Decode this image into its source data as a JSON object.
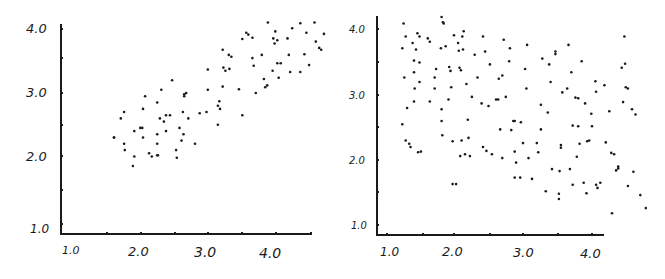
{
  "chart_data": [
    {
      "type": "scatter",
      "title": "",
      "xlabel": "",
      "ylabel": "",
      "xlim": [
        0.9,
        4.6
      ],
      "ylim": [
        0.9,
        4.1
      ],
      "grid": false,
      "legend": null,
      "x_ticks": [
        "1.0",
        "2.0",
        "3.0",
        "4.0"
      ],
      "y_ticks": [
        "1.0",
        "2.0",
        "3.0",
        "4.0"
      ],
      "trend": "positive correlation",
      "points": [
        [
          1.6,
          2.3
        ],
        [
          1.6,
          2.3
        ],
        [
          1.7,
          2.6
        ],
        [
          1.75,
          2.7
        ],
        [
          1.75,
          2.2
        ],
        [
          1.76,
          2.1
        ],
        [
          1.9,
          2.4
        ],
        [
          1.9,
          2.0
        ],
        [
          1.88,
          1.85
        ],
        [
          1.99,
          2.45
        ],
        [
          2.02,
          2.45
        ],
        [
          2.03,
          2.3
        ],
        [
          2.03,
          2.75
        ],
        [
          2.06,
          2.95
        ],
        [
          2.12,
          2.05
        ],
        [
          2.16,
          2.0
        ],
        [
          2.24,
          2.2
        ],
        [
          2.24,
          2.35
        ],
        [
          2.24,
          2.85
        ],
        [
          2.24,
          2.02
        ],
        [
          2.25,
          2.02
        ],
        [
          2.28,
          2.6
        ],
        [
          2.3,
          3.05
        ],
        [
          2.37,
          2.4
        ],
        [
          2.37,
          2.65
        ],
        [
          2.34,
          2.55
        ],
        [
          2.43,
          2.65
        ],
        [
          2.46,
          3.2
        ],
        [
          2.52,
          2.1
        ],
        [
          2.53,
          1.98
        ],
        [
          2.57,
          2.45
        ],
        [
          2.6,
          2.25
        ],
        [
          2.63,
          2.35
        ],
        [
          2.62,
          2.7
        ],
        [
          2.64,
          2.95
        ],
        [
          2.64,
          2.98
        ],
        [
          2.67,
          3.0
        ],
        [
          2.7,
          2.6
        ],
        [
          2.8,
          2.2
        ],
        [
          2.87,
          2.68
        ],
        [
          2.97,
          2.7
        ],
        [
          2.99,
          3.05
        ],
        [
          2.99,
          3.37
        ],
        [
          3.14,
          2.8
        ],
        [
          3.14,
          2.5
        ],
        [
          3.16,
          2.87
        ],
        [
          3.17,
          2.75
        ],
        [
          3.21,
          3.1
        ],
        [
          3.21,
          3.68
        ],
        [
          3.22,
          3.4
        ],
        [
          3.25,
          3.35
        ],
        [
          3.3,
          3.6
        ],
        [
          3.31,
          3.38
        ],
        [
          3.34,
          3.57
        ],
        [
          3.5,
          2.65
        ],
        [
          3.45,
          3.06
        ],
        [
          3.5,
          3.85
        ],
        [
          3.56,
          3.95
        ],
        [
          3.59,
          3.92
        ],
        [
          3.65,
          3.87
        ],
        [
          3.65,
          3.55
        ],
        [
          3.67,
          3.43
        ],
        [
          3.7,
          3.0
        ],
        [
          3.79,
          3.6
        ],
        [
          3.82,
          3.22
        ],
        [
          3.84,
          3.09
        ],
        [
          3.87,
          3.12
        ],
        [
          3.88,
          4.11
        ],
        [
          3.96,
          3.86
        ],
        [
          3.95,
          3.35
        ],
        [
          3.98,
          3.78
        ],
        [
          3.99,
          3.97
        ],
        [
          4.02,
          3.47
        ],
        [
          4.04,
          3.24
        ],
        [
          4.02,
          3.83
        ],
        [
          4.07,
          3.47
        ],
        [
          4.17,
          3.86
        ],
        [
          4.19,
          3.6
        ],
        [
          4.21,
          3.33
        ],
        [
          4.24,
          4.02
        ],
        [
          4.36,
          4.1
        ],
        [
          4.36,
          3.33
        ],
        [
          4.42,
          3.61
        ],
        [
          4.45,
          3.95
        ],
        [
          4.57,
          4.11
        ],
        [
          4.59,
          3.81
        ],
        [
          4.49,
          3.44
        ],
        [
          4.67,
          3.68
        ],
        [
          4.71,
          3.93
        ],
        [
          4.64,
          3.71
        ]
      ]
    },
    {
      "type": "scatter",
      "title": "",
      "xlabel": "",
      "ylabel": "",
      "xlim": [
        0.85,
        4.2
      ],
      "ylim": [
        0.85,
        4.15
      ],
      "grid": false,
      "legend": null,
      "x_ticks": [
        "1.0",
        "2.0",
        "3.0",
        "4.0"
      ],
      "y_ticks": [
        "1.0",
        "2.0",
        "3.0",
        "4.0"
      ],
      "trend": "weak negative correlation",
      "points": [
        [
          1.25,
          3.72
        ],
        [
          1.27,
          4.1
        ],
        [
          1.3,
          3.9
        ],
        [
          1.28,
          3.27
        ],
        [
          1.32,
          2.8
        ],
        [
          1.25,
          2.55
        ],
        [
          1.3,
          2.3
        ],
        [
          1.35,
          2.25
        ],
        [
          1.37,
          2.2
        ],
        [
          1.4,
          3.8
        ],
        [
          1.42,
          3.53
        ],
        [
          1.42,
          3.35
        ],
        [
          1.43,
          3.1
        ],
        [
          1.42,
          2.9
        ],
        [
          1.45,
          3.7
        ],
        [
          1.47,
          3.95
        ],
        [
          1.5,
          3.9
        ],
        [
          1.5,
          3.5
        ],
        [
          1.5,
          3.2
        ],
        [
          1.48,
          2.12
        ],
        [
          1.52,
          2.13
        ],
        [
          1.62,
          3.87
        ],
        [
          1.65,
          3.82
        ],
        [
          1.65,
          2.9
        ],
        [
          1.72,
          3.27
        ],
        [
          1.72,
          3.1
        ],
        [
          1.74,
          3.4
        ],
        [
          1.81,
          3.72
        ],
        [
          1.82,
          4.2
        ],
        [
          1.84,
          4.12
        ],
        [
          1.85,
          4.1
        ],
        [
          1.82,
          2.78
        ],
        [
          1.82,
          2.6
        ],
        [
          1.83,
          2.38
        ],
        [
          1.88,
          3.75
        ],
        [
          1.93,
          3.43
        ],
        [
          1.95,
          3.37
        ],
        [
          1.96,
          3.12
        ],
        [
          1.92,
          2.93
        ],
        [
          1.98,
          2.29
        ],
        [
          1.98,
          1.63
        ],
        [
          2.03,
          1.63
        ],
        [
          2.0,
          3.92
        ],
        [
          2.06,
          3.8
        ],
        [
          2.07,
          3.68
        ],
        [
          2.08,
          3.42
        ],
        [
          2.1,
          3.38
        ],
        [
          2.13,
          3.7
        ],
        [
          2.12,
          3.9
        ],
        [
          2.14,
          3.98
        ],
        [
          2.09,
          2.06
        ],
        [
          2.11,
          2.3
        ],
        [
          2.16,
          2.09
        ],
        [
          2.18,
          3.17
        ],
        [
          2.2,
          2.62
        ],
        [
          2.21,
          2.34
        ],
        [
          2.23,
          2.06
        ],
        [
          2.26,
          2.97
        ],
        [
          2.3,
          3.62
        ],
        [
          2.34,
          3.27
        ],
        [
          2.4,
          2.87
        ],
        [
          2.42,
          3.9
        ],
        [
          2.42,
          2.2
        ],
        [
          2.45,
          3.67
        ],
        [
          2.47,
          2.14
        ],
        [
          2.5,
          2.83
        ],
        [
          2.52,
          3.47
        ],
        [
          2.55,
          2.09
        ],
        [
          2.61,
          2.93
        ],
        [
          2.64,
          2.93
        ],
        [
          2.65,
          3.25
        ],
        [
          2.67,
          2.47
        ],
        [
          2.7,
          2.03
        ],
        [
          2.7,
          3.3
        ],
        [
          2.72,
          3.85
        ],
        [
          2.75,
          2.97
        ],
        [
          2.8,
          3.52
        ],
        [
          2.81,
          3.72
        ],
        [
          2.83,
          2.46
        ],
        [
          2.86,
          2.6
        ],
        [
          2.88,
          2.6
        ],
        [
          2.88,
          2.13
        ],
        [
          2.9,
          1.96
        ],
        [
          2.88,
          1.73
        ],
        [
          2.97,
          2.58
        ],
        [
          2.96,
          1.73
        ],
        [
          3.0,
          2.26
        ],
        [
          3.03,
          3.4
        ],
        [
          3.05,
          3.1
        ],
        [
          3.06,
          3.77
        ],
        [
          3.08,
          2.03
        ],
        [
          3.13,
          1.71
        ],
        [
          3.2,
          2.26
        ],
        [
          3.22,
          2.12
        ],
        [
          3.26,
          2.85
        ],
        [
          3.26,
          2.47
        ],
        [
          3.28,
          3.56
        ],
        [
          3.33,
          1.52
        ],
        [
          3.36,
          2.73
        ],
        [
          3.38,
          3.47
        ],
        [
          3.4,
          3.2
        ],
        [
          3.42,
          1.86
        ],
        [
          3.47,
          3.67
        ],
        [
          3.47,
          3.63
        ],
        [
          3.52,
          1.48
        ],
        [
          3.52,
          1.4
        ],
        [
          3.53,
          1.83
        ],
        [
          3.55,
          2.23
        ],
        [
          3.55,
          2.19
        ],
        [
          3.57,
          3.04
        ],
        [
          3.64,
          3.1
        ],
        [
          3.66,
          3.77
        ],
        [
          3.68,
          1.86
        ],
        [
          3.7,
          3.35
        ],
        [
          3.72,
          2.53
        ],
        [
          3.72,
          1.62
        ],
        [
          3.76,
          2.96
        ],
        [
          3.78,
          2.05
        ],
        [
          3.8,
          2.95
        ],
        [
          3.8,
          2.52
        ],
        [
          3.82,
          2.25
        ],
        [
          3.85,
          3.52
        ],
        [
          3.88,
          1.65
        ],
        [
          3.9,
          2.87
        ],
        [
          3.92,
          1.49
        ],
        [
          3.93,
          2.29
        ],
        [
          3.96,
          2.3
        ],
        [
          3.99,
          2.71
        ],
        [
          4.0,
          2.52
        ],
        [
          4.05,
          3.21
        ],
        [
          4.06,
          3.05
        ],
        [
          4.06,
          1.62
        ],
        [
          4.08,
          1.57
        ],
        [
          4.12,
          1.65
        ],
        [
          4.18,
          3.15
        ],
        [
          4.2,
          2.27
        ],
        [
          4.25,
          2.75
        ],
        [
          4.29,
          1.18
        ],
        [
          4.28,
          2.11
        ],
        [
          4.32,
          2.09
        ],
        [
          4.35,
          1.84
        ],
        [
          4.38,
          1.87
        ],
        [
          4.38,
          1.9
        ],
        [
          4.43,
          3.42
        ],
        [
          4.48,
          3.48
        ],
        [
          4.45,
          2.89
        ],
        [
          4.49,
          3.12
        ],
        [
          4.52,
          3.1
        ],
        [
          4.47,
          3.9
        ],
        [
          4.52,
          1.6
        ],
        [
          4.58,
          2.78
        ],
        [
          4.63,
          2.7
        ],
        [
          4.6,
          1.82
        ],
        [
          4.7,
          1.46
        ],
        [
          4.78,
          1.26
        ]
      ]
    }
  ],
  "left_chart": {
    "x_tick_labels": [
      "1.0",
      "2.0",
      "3.0",
      "4.0"
    ],
    "y_tick_labels": [
      "1.0",
      "2.0",
      "3.0",
      "4.0"
    ]
  },
  "right_chart": {
    "x_tick_labels": [
      "1.0",
      "2.0",
      "3.0",
      "4.0"
    ],
    "y_tick_labels": [
      "1.0",
      "2.0",
      "3.0",
      "4.0"
    ]
  },
  "colors": {
    "ink": "#1a1a1a",
    "background": "#ffffff"
  }
}
